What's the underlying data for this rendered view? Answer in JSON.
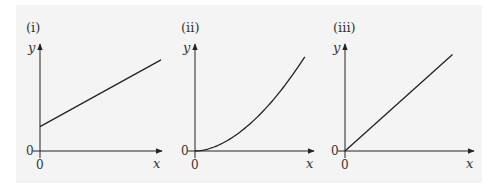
{
  "chart_data": [
    {
      "type": "line",
      "panel_label": "(i)",
      "xlabel": "x",
      "ylabel": "y",
      "x_origin_label": "0",
      "y_origin_label": "0",
      "xlim": [
        0,
        1
      ],
      "ylim": [
        0,
        1
      ],
      "grid": false,
      "description": "straight line with positive y-intercept",
      "x": [
        0,
        1
      ],
      "y": [
        0.23,
        0.86
      ]
    },
    {
      "type": "line",
      "panel_label": "(ii)",
      "xlabel": "x",
      "ylabel": "y",
      "x_origin_label": "0",
      "y_origin_label": "0",
      "xlim": [
        0,
        1
      ],
      "ylim": [
        0,
        1
      ],
      "grid": false,
      "description": "curve through origin, increasing and concave up",
      "x": [
        0,
        0.1,
        0.2,
        0.3,
        0.4,
        0.5,
        0.6,
        0.7,
        0.8,
        0.9
      ],
      "y": [
        0,
        0.018,
        0.062,
        0.13,
        0.22,
        0.32,
        0.44,
        0.57,
        0.72,
        0.88
      ]
    },
    {
      "type": "line",
      "panel_label": "(iii)",
      "xlabel": "x",
      "ylabel": "y",
      "x_origin_label": "0",
      "y_origin_label": "0",
      "xlim": [
        0,
        1
      ],
      "ylim": [
        0,
        1
      ],
      "grid": false,
      "description": "straight line through origin",
      "x": [
        0,
        0.84
      ],
      "y": [
        0,
        0.91
      ]
    }
  ]
}
